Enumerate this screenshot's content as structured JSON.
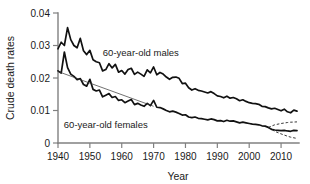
{
  "chart_data": {
    "type": "line",
    "title": "",
    "xlabel": "Year",
    "ylabel": "Crude death rates",
    "xlim": [
      1940,
      2015
    ],
    "ylim": [
      0,
      0.04
    ],
    "grid": false,
    "legend_position": "inline-annotation",
    "xticks": [
      1940,
      1950,
      1960,
      1970,
      1980,
      1990,
      2000,
      2010
    ],
    "xtick_labels": [
      "1940",
      "1950",
      "1960",
      "1970",
      "1980",
      "1990",
      "2000",
      "2010"
    ],
    "yticks": [
      0,
      0.01,
      0.02,
      0.03,
      0.04
    ],
    "ytick_labels": [
      "0",
      "0.01",
      "0.02",
      "0.03",
      "0.04"
    ],
    "annotations": [
      {
        "text": "60-year-old males",
        "x": 1966,
        "y": 0.0268
      },
      {
        "text": "60-year-old females",
        "x": 1955,
        "y": 0.0046
      }
    ],
    "series": [
      {
        "name": "60-year-old males",
        "style": "solid",
        "color": "#111111",
        "x": [
          1940,
          1941,
          1942,
          1943,
          1944,
          1945,
          1946,
          1947,
          1948,
          1949,
          1950,
          1951,
          1952,
          1953,
          1954,
          1955,
          1956,
          1957,
          1958,
          1959,
          1960,
          1961,
          1962,
          1963,
          1964,
          1965,
          1966,
          1967,
          1968,
          1969,
          1970,
          1971,
          1972,
          1973,
          1974,
          1975,
          1976,
          1977,
          1978,
          1979,
          1980,
          1981,
          1982,
          1983,
          1984,
          1985,
          1986,
          1987,
          1988,
          1989,
          1990,
          1991,
          1992,
          1993,
          1994,
          1995,
          1996,
          1997,
          1998,
          1999,
          2000,
          2001,
          2002,
          2003,
          2004,
          2005,
          2006,
          2007,
          2008,
          2009,
          2010,
          2011,
          2012,
          2013,
          2014,
          2015
        ],
        "values": [
          0.029,
          0.031,
          0.03,
          0.0355,
          0.0318,
          0.03,
          0.0293,
          0.0322,
          0.0284,
          0.0272,
          0.0285,
          0.0256,
          0.025,
          0.0247,
          0.0222,
          0.0226,
          0.0244,
          0.0231,
          0.0242,
          0.0218,
          0.0223,
          0.0212,
          0.0226,
          0.023,
          0.0211,
          0.0218,
          0.0212,
          0.0205,
          0.0225,
          0.0216,
          0.0234,
          0.021,
          0.0217,
          0.0212,
          0.0203,
          0.0196,
          0.0202,
          0.0203,
          0.0199,
          0.0183,
          0.0184,
          0.017,
          0.0163,
          0.0167,
          0.0162,
          0.016,
          0.0157,
          0.0154,
          0.0158,
          0.0152,
          0.0145,
          0.0143,
          0.0139,
          0.0144,
          0.0138,
          0.014,
          0.0136,
          0.013,
          0.0133,
          0.0128,
          0.0124,
          0.0122,
          0.0121,
          0.0119,
          0.0113,
          0.0112,
          0.0108,
          0.0105,
          0.0107,
          0.0103,
          0.0099,
          0.0104,
          0.0096,
          0.0093,
          0.0101,
          0.0098
        ]
      },
      {
        "name": "60-year-old females",
        "style": "solid",
        "color": "#111111",
        "x": [
          1940,
          1941,
          1942,
          1943,
          1944,
          1945,
          1946,
          1947,
          1948,
          1949,
          1950,
          1951,
          1952,
          1953,
          1954,
          1955,
          1956,
          1957,
          1958,
          1959,
          1960,
          1961,
          1962,
          1963,
          1964,
          1965,
          1966,
          1967,
          1968,
          1969,
          1970,
          1971,
          1972,
          1973,
          1974,
          1975,
          1976,
          1977,
          1978,
          1979,
          1980,
          1981,
          1982,
          1983,
          1984,
          1985,
          1986,
          1987,
          1988,
          1989,
          1990,
          1991,
          1992,
          1993,
          1994,
          1995,
          1996,
          1997,
          1998,
          1999,
          2000,
          2001,
          2002,
          2003,
          2004,
          2005,
          2006,
          2007,
          2008,
          2009,
          2010,
          2011,
          2012,
          2013,
          2014,
          2015
        ],
        "values": [
          0.0222,
          0.0215,
          0.028,
          0.0232,
          0.0212,
          0.0205,
          0.0195,
          0.0198,
          0.018,
          0.0175,
          0.0196,
          0.0165,
          0.016,
          0.0163,
          0.0142,
          0.0147,
          0.0152,
          0.014,
          0.0143,
          0.0131,
          0.0133,
          0.0124,
          0.0129,
          0.0134,
          0.0118,
          0.0122,
          0.0117,
          0.0113,
          0.0122,
          0.0115,
          0.0131,
          0.011,
          0.0109,
          0.0105,
          0.01,
          0.0096,
          0.0098,
          0.0095,
          0.0091,
          0.0086,
          0.0087,
          0.008,
          0.0078,
          0.008,
          0.0076,
          0.0075,
          0.0073,
          0.0071,
          0.0074,
          0.0072,
          0.0068,
          0.0069,
          0.0066,
          0.007,
          0.0067,
          0.0068,
          0.0065,
          0.0062,
          0.0064,
          0.0062,
          0.006,
          0.0058,
          0.0057,
          0.0056,
          0.0053,
          0.0052,
          0.0048,
          0.0042,
          0.004,
          0.0039,
          0.0038,
          0.0039,
          0.0037,
          0.0036,
          0.0039,
          0.0038
        ]
      },
      {
        "name": "fitted trend",
        "style": "thin-solid",
        "color": "#333333",
        "x": [
          1940,
          1970
        ],
        "values": [
          0.022,
          0.0113
        ]
      },
      {
        "name": "projection upper",
        "style": "dashed",
        "color": "#222222",
        "x": [
          2006,
          2008,
          2010,
          2012,
          2013,
          2015
        ],
        "values": [
          0.0048,
          0.0056,
          0.006,
          0.0063,
          0.0064,
          0.0065
        ]
      },
      {
        "name": "projection lower",
        "style": "dashed",
        "color": "#222222",
        "x": [
          2006,
          2008,
          2010,
          2012,
          2013,
          2015
        ],
        "values": [
          0.0048,
          0.0036,
          0.0028,
          0.0021,
          0.0018,
          0.0014
        ]
      }
    ]
  }
}
